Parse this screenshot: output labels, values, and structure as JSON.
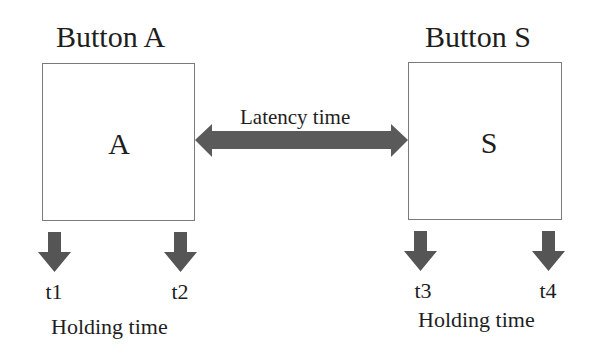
{
  "diagram": {
    "buttons": [
      {
        "id": "A",
        "title": "Button A",
        "letter": "A"
      },
      {
        "id": "S",
        "title": "Button S",
        "letter": "S"
      }
    ],
    "latency": {
      "label": "Latency time",
      "icon": "double-headed-arrow-icon"
    },
    "time_markers": [
      {
        "label": "t1",
        "icon": "down-arrow-icon"
      },
      {
        "label": "t2",
        "icon": "down-arrow-icon"
      },
      {
        "label": "t3",
        "icon": "down-arrow-icon"
      },
      {
        "label": "t4",
        "icon": "down-arrow-icon"
      }
    ],
    "holding": [
      {
        "label": "Holding time",
        "button": "A"
      },
      {
        "label": "Holding time",
        "button": "S"
      }
    ],
    "colors": {
      "arrow_fill": "#5a5a5a",
      "box_border": "#7a7a7a",
      "text": "#1e1e1e",
      "background": "#ffffff"
    }
  }
}
